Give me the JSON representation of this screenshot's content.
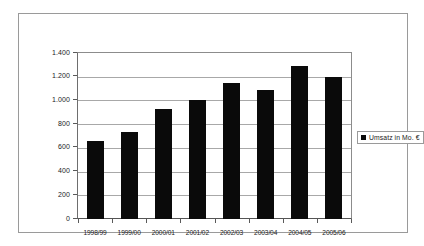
{
  "chart_data": {
    "type": "bar",
    "title": "",
    "subtitle": "",
    "xlabel": "",
    "ylabel": "",
    "categories": [
      "1998/99",
      "1999/00",
      "2000/01",
      "2001/02",
      "2002/03",
      "2003/04",
      "2004/05",
      "2005/06"
    ],
    "series": [
      {
        "name": "Umsatz in Mo. €",
        "values": [
          660,
          730,
          930,
          1000,
          1150,
          1085,
          1290,
          1200
        ],
        "color": "#0a0a0a"
      }
    ],
    "ylim": [
      0,
      1400
    ],
    "ytick_values": [
      1400,
      1200,
      1000,
      800,
      600,
      400,
      200,
      0
    ],
    "ytick_labels": [
      "1.400",
      "1.200",
      "1.000",
      "800",
      "600",
      "400",
      "200",
      "0"
    ],
    "grid": true,
    "grid_axis": "y",
    "legend_position": "right",
    "legend_entries": [
      "Umsatz in Mo. €"
    ],
    "annotations": [],
    "bar_color": "#0a0a0a",
    "plot_background": "#ffffff",
    "frame_color": "#9a9a9a",
    "gridline_color": "#a8a8a8"
  },
  "legend": {
    "entries": [
      {
        "label": "Umsatz in Mo. €",
        "marker": "square-marker"
      }
    ]
  }
}
